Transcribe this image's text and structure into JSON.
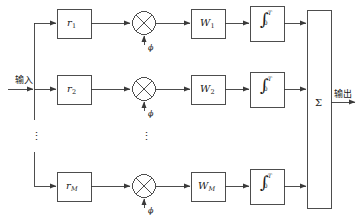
{
  "diagram": {
    "type": "block-diagram",
    "background": "#ffffff",
    "line_color": "#3a3a3a",
    "text_color": "#1a1a1a"
  },
  "io": {
    "input_label": "输入",
    "output_label": "输出"
  },
  "summer": {
    "symbol": "Σ",
    "name": "summing-block"
  },
  "ellipsis": {
    "glyph": "⋮",
    "left_label": "⋮",
    "mid_label": "⋮"
  },
  "branches": [
    {
      "id": "branch-1",
      "delay": {
        "base": "r",
        "sub": "1"
      },
      "mixer": {
        "symbol": "⊗",
        "lo_label": "ϕ"
      },
      "weight": {
        "base": "W",
        "sub": "1"
      },
      "integrator": {
        "symbol": "∫",
        "upper": "T",
        "lower": "0"
      }
    },
    {
      "id": "branch-2",
      "delay": {
        "base": "r",
        "sub": "2"
      },
      "mixer": {
        "symbol": "⊗",
        "lo_label": "ϕ"
      },
      "weight": {
        "base": "W",
        "sub": "2"
      },
      "integrator": {
        "symbol": "∫",
        "upper": "T",
        "lower": "0"
      }
    },
    {
      "id": "branch-M",
      "delay": {
        "base": "r",
        "sub": "M"
      },
      "mixer": {
        "symbol": "⊗",
        "lo_label": "ϕ"
      },
      "weight": {
        "base": "W",
        "sub": "M"
      },
      "integrator": {
        "symbol": "∫",
        "upper": "T",
        "lower": "0"
      }
    }
  ]
}
